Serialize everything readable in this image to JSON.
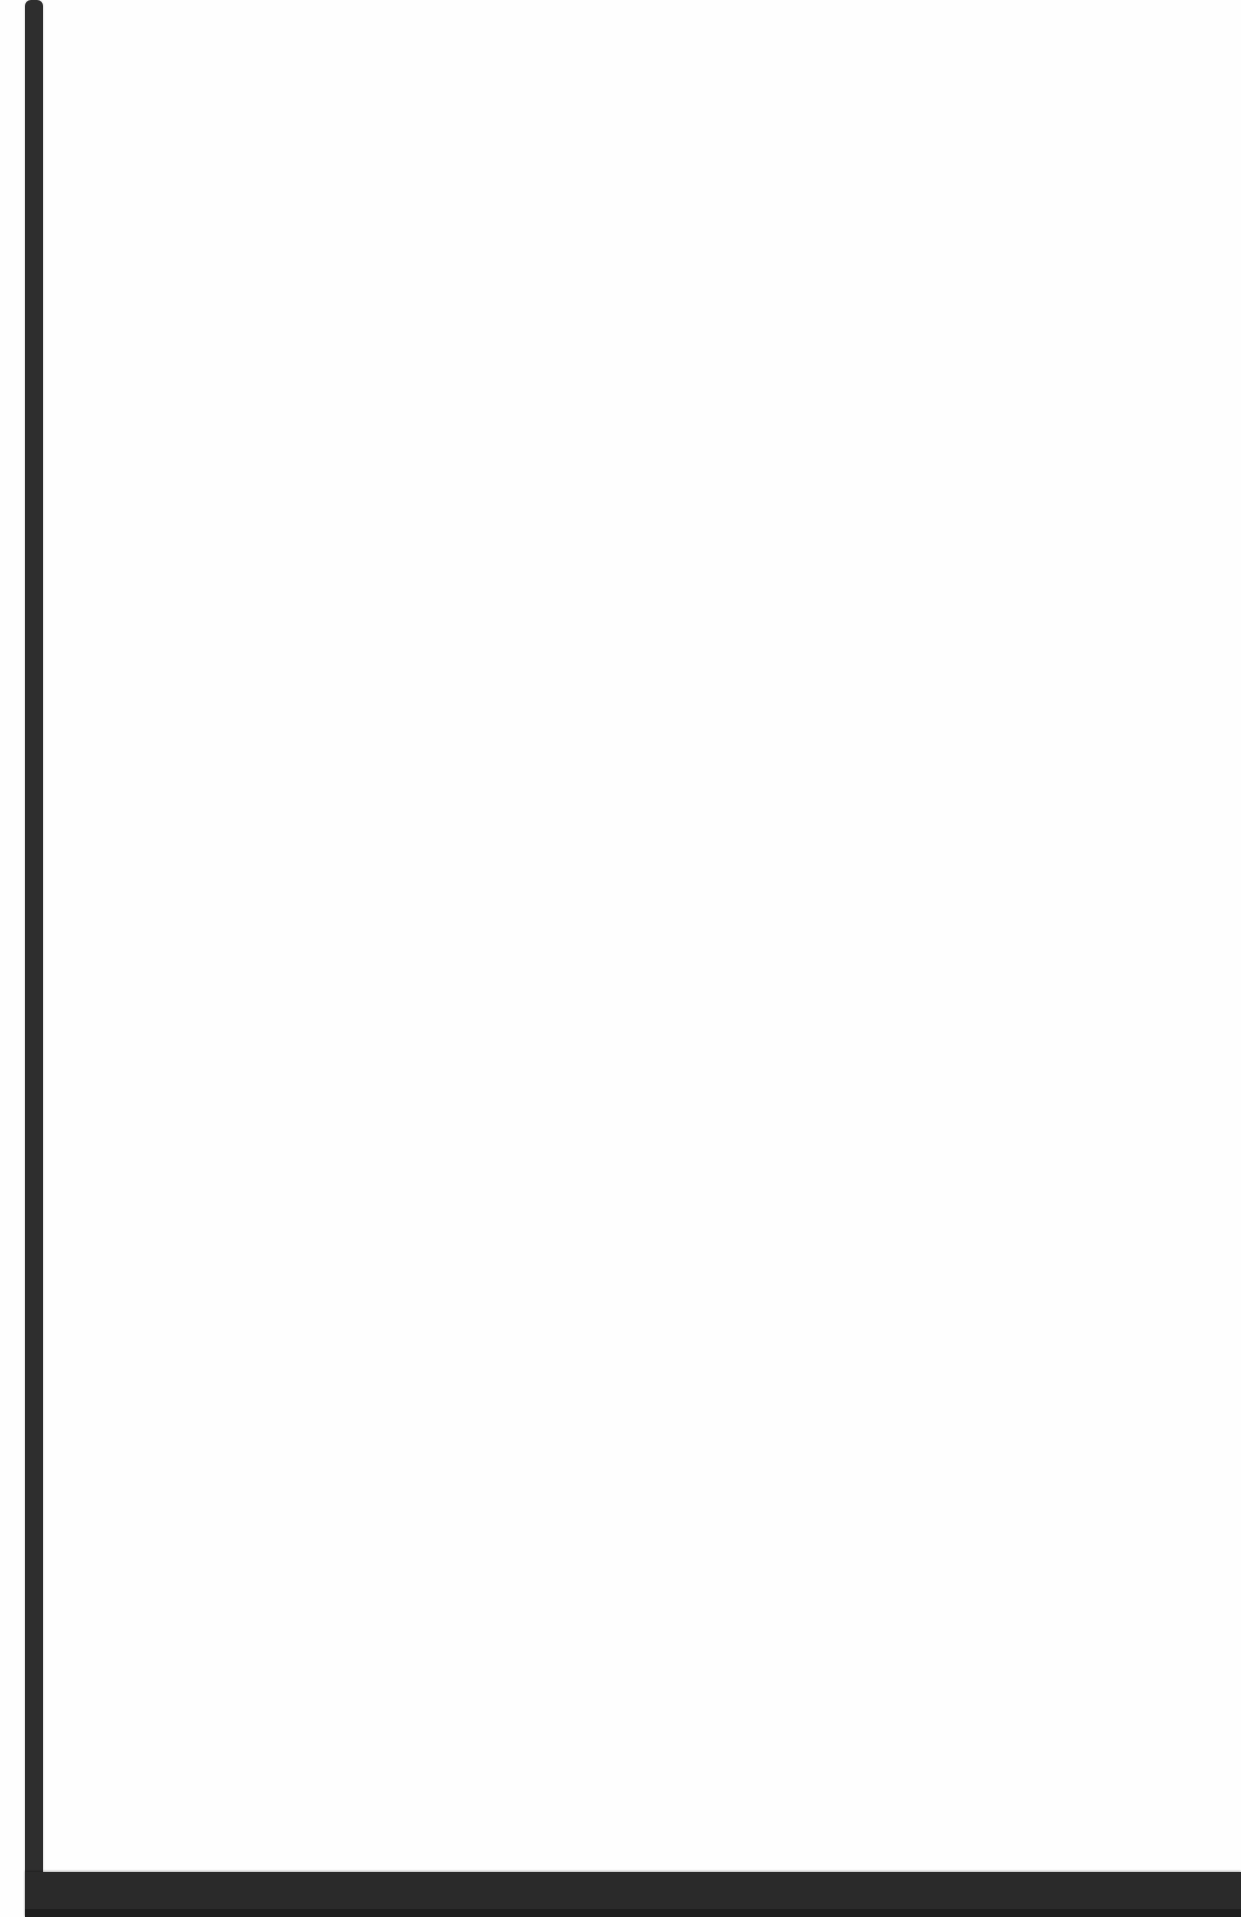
{
  "document": {
    "page_text": "",
    "edge_color": "#2e2e2e",
    "background_color": "#fefefe"
  }
}
